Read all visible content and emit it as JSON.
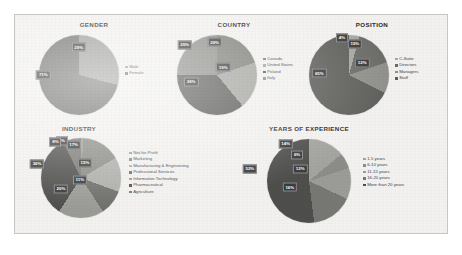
{
  "figure": {
    "background_color": "#f2f1ef",
    "border_color": "#c9c6c2"
  },
  "chart_data": [
    {
      "type": "pie",
      "title": "GENDER",
      "categories": [
        "Male",
        "Female"
      ],
      "values": [
        29,
        71
      ],
      "value_labels": [
        "29%",
        "71%"
      ],
      "colors": [
        "#9b9b97",
        "#6e6e6a"
      ],
      "legend": "right",
      "xlabel": "",
      "ylabel": ""
    },
    {
      "type": "pie",
      "title": "COUNTRY",
      "categories": [
        "Canada",
        "United States",
        "Poland",
        "Italy"
      ],
      "values": [
        20,
        19,
        36,
        25
      ],
      "value_labels": [
        "20%",
        "19%",
        "36%",
        "25%"
      ],
      "colors": [
        "#7e7e7a",
        "#a4a4a0",
        "#5a5a57",
        "#8e8e8a"
      ],
      "legend": "right",
      "xlabel": "",
      "ylabel": ""
    },
    {
      "type": "pie",
      "title": "POSITION",
      "categories": [
        "C-Suite",
        "Directors",
        "Managers",
        "Staff"
      ],
      "values": [
        4,
        15,
        12,
        65
      ],
      "value_labels": [
        "4%",
        "15%",
        "12%",
        "65%"
      ],
      "colors": [
        "#a6a6a2",
        "#6b6b68",
        "#8f8f8b",
        "#5e5e5b"
      ],
      "legend": "right",
      "xlabel": "",
      "ylabel": ""
    },
    {
      "type": "pie",
      "title": "INDUSTRY",
      "categories": [
        "Not-for-Profit",
        "Marketing",
        "Manufacturing & Engineering",
        "Professional Services",
        "Information Technology",
        "Pharmaceutical",
        "Agriculture"
      ],
      "values": [
        1,
        17,
        15,
        11,
        20,
        36,
        8
      ],
      "value_labels": [
        "1%",
        "17%",
        "15%",
        "11%",
        "20%",
        "36%",
        "8%"
      ],
      "colors": [
        "#9d9d99",
        "#8b8b87",
        "#aeaeaa",
        "#6f6f6c",
        "#9a9a96",
        "#4f4f4d",
        "#7a7a77"
      ],
      "legend": "right",
      "xlabel": "",
      "ylabel": ""
    },
    {
      "type": "pie",
      "title": "YEARS OF EXPERIENCE",
      "categories": [
        "1-5 years",
        "6-10 years",
        "11-15 years",
        "16-20 years",
        "More than 20 years"
      ],
      "values": [
        14,
        6,
        12,
        16,
        52
      ],
      "value_labels": [
        "14%",
        "6%",
        "12%",
        "16%",
        "52%"
      ],
      "colors": [
        "#a3a3a0",
        "#8c8c89",
        "#9b9b97",
        "#777774",
        "#4e4e4c"
      ],
      "legend": "right",
      "xlabel": "",
      "ylabel": ""
    }
  ]
}
